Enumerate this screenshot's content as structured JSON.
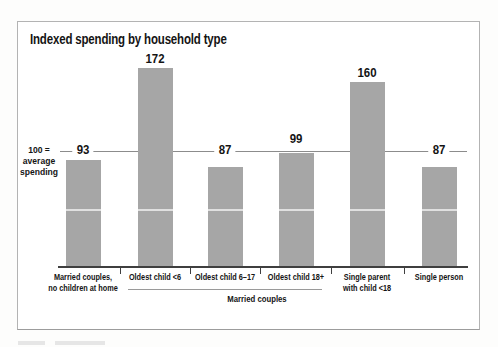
{
  "chart_data": {
    "type": "bar",
    "title": "Indexed spending by household type",
    "categories": [
      "Married couples,\nno children at home",
      "Oldest child <6",
      "Oldest child 6–17",
      "Oldest child 18+",
      "Single parent\nwith child <18",
      "Single person"
    ],
    "values": [
      93,
      172,
      87,
      99,
      160,
      87
    ],
    "ylim": [
      0,
      200
    ],
    "grid": "off",
    "legend": "none",
    "reference_line": {
      "value": 100
    },
    "reference_label": "100 =\naverage\nspending",
    "group_label": "Married couples",
    "group_span": [
      "Oldest child <6",
      "Oldest child 6–17",
      "Oldest child 18+"
    ],
    "bar_color": "#a6a6a6",
    "axis_color": "#3f3f3f",
    "reference_line_color": "#8c8c8c"
  }
}
